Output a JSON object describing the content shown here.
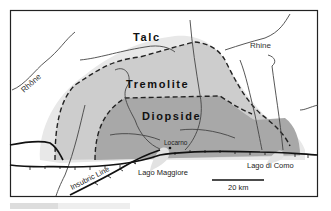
{
  "map": {
    "zones": [
      {
        "name": "Talc",
        "fill": "#e6e6e6"
      },
      {
        "name": "Tremolite",
        "fill": "#cfcfcf"
      },
      {
        "name": "Diopside",
        "fill": "#a9a9a9"
      }
    ],
    "rivers": [
      {
        "label": "Rhône"
      },
      {
        "label": "Rhine"
      }
    ],
    "places": [
      {
        "label": "Locarno"
      },
      {
        "label": "Lago Maggiore"
      },
      {
        "label": "Lago di Como"
      }
    ],
    "faults": [
      {
        "label": "Insubric Line"
      }
    ],
    "scale_bar": {
      "label": "20 km"
    }
  }
}
